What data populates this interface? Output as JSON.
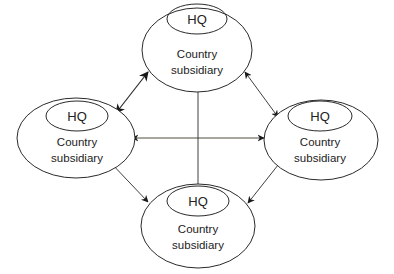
{
  "diagram": {
    "type": "network",
    "colors": {
      "stroke": "#2a2a2a",
      "text": "#222222",
      "background": "#ffffff"
    },
    "nodes": [
      {
        "id": "top",
        "hq_label": "HQ",
        "line1": "Country",
        "line2": "subsidiary"
      },
      {
        "id": "left",
        "hq_label": "HQ",
        "line1": "Country",
        "line2": "subsidiary"
      },
      {
        "id": "right",
        "hq_label": "HQ",
        "line1": "Country",
        "line2": "subsidiary"
      },
      {
        "id": "bottom",
        "hq_label": "HQ",
        "line1": "Country",
        "line2": "subsidiary"
      }
    ],
    "edges": [
      {
        "from": "top",
        "to": "left",
        "style": "bidirectional-arrow"
      },
      {
        "from": "top",
        "to": "right",
        "style": "bidirectional-arrow"
      },
      {
        "from": "left",
        "to": "bottom",
        "style": "bidirectional-arrow"
      },
      {
        "from": "right",
        "to": "bottom",
        "style": "bidirectional-arrow"
      },
      {
        "from": "left",
        "to": "right",
        "style": "bidirectional-arrow"
      },
      {
        "from": "top",
        "to": "bottom",
        "style": "plain-line"
      }
    ]
  }
}
